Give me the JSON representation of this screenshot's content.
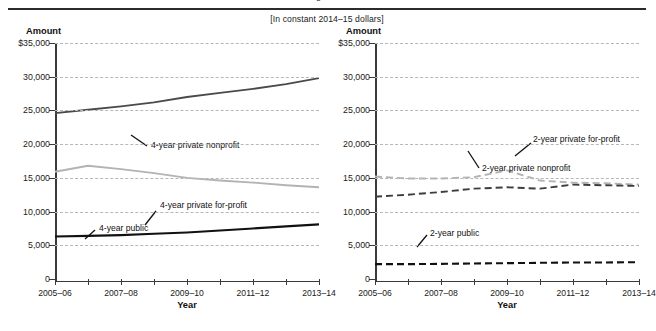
{
  "figure": {
    "units_note": "[In constant 2014–15 dollars]",
    "amount_axis_label": "Amount",
    "x_axis_title": "Year"
  },
  "axis": {
    "y_ticks": [
      "$35,000",
      "30,000",
      "25,000",
      "20,000",
      "15,000",
      "10,000",
      "5,000",
      "0"
    ],
    "y_values": [
      35000,
      30000,
      25000,
      20000,
      15000,
      10000,
      5000,
      0
    ],
    "x_tick_labels": [
      "2005–06",
      "2007–08",
      "2009–10",
      "2011–12",
      "2013–14"
    ]
  },
  "colors": {
    "public_line": "#111111",
    "private_nonprofit_line": "#4a4a4a",
    "private_forprofit_line": "#b3b3b3",
    "gridline": "#b4b8bd",
    "axis": "#3a3a3a",
    "rule": "#2b2b2b"
  },
  "chart_data": [
    {
      "type": "line",
      "panel": "left",
      "title": "",
      "xlabel": "Year",
      "ylabel": "Amount",
      "ylim": [
        0,
        35000
      ],
      "grid": true,
      "legend": "inline-annotations",
      "x": [
        "2005–06",
        "2006–07",
        "2007–08",
        "2008–09",
        "2009–10",
        "2010–11",
        "2011–12",
        "2012–13",
        "2013–14"
      ],
      "series": [
        {
          "name": "4-year private nonprofit",
          "style": "solid",
          "color": "#4a4a4a",
          "values": [
            24600,
            25100,
            25600,
            26200,
            27000,
            27600,
            28200,
            28900,
            29800
          ]
        },
        {
          "name": "4-year private for-profit",
          "style": "solid",
          "color": "#b3b3b3",
          "values": [
            15900,
            16800,
            16300,
            15700,
            15000,
            14600,
            14300,
            13900,
            13600
          ]
        },
        {
          "name": "4-year public",
          "style": "solid",
          "color": "#111111",
          "values": [
            6300,
            6400,
            6500,
            6700,
            6900,
            7200,
            7500,
            7800,
            8100
          ]
        }
      ]
    },
    {
      "type": "line",
      "panel": "right",
      "title": "",
      "xlabel": "Year",
      "ylabel": "Amount",
      "ylim": [
        0,
        35000
      ],
      "grid": true,
      "legend": "inline-annotations",
      "x": [
        "2005–06",
        "2006–07",
        "2007–08",
        "2008–09",
        "2009–10",
        "2010–11",
        "2011–12",
        "2012–13",
        "2013–14"
      ],
      "series": [
        {
          "name": "2-year private for-profit",
          "style": "dashed",
          "color": "#b3b3b3",
          "values": [
            15200,
            14900,
            14900,
            15100,
            16100,
            14600,
            14300,
            14200,
            14000
          ]
        },
        {
          "name": "2-year private nonprofit",
          "style": "dashed",
          "color": "#3d3d3d",
          "values": [
            12200,
            12500,
            12900,
            13400,
            13600,
            13400,
            14000,
            13900,
            13800
          ]
        },
        {
          "name": "2-year public",
          "style": "dashed",
          "color": "#111111",
          "values": [
            2200,
            2200,
            2250,
            2300,
            2350,
            2400,
            2450,
            2450,
            2500
          ]
        }
      ]
    }
  ],
  "annotations": {
    "left": [
      {
        "text": "4-year private nonprofit"
      },
      {
        "text": "4-year private for-profit"
      },
      {
        "text": "4-year public"
      }
    ],
    "right": [
      {
        "text": "2-year private for-profit"
      },
      {
        "text": "2-year private nonprofit"
      },
      {
        "text": "2-year public"
      }
    ]
  }
}
